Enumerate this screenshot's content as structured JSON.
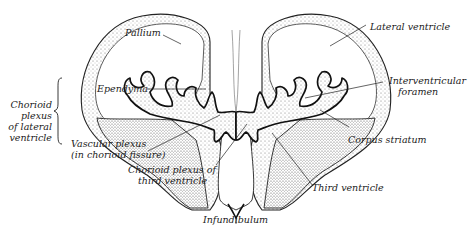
{
  "figure": {
    "labels": {
      "pallium": "Pallium",
      "lateral_ventricle": "Lateral ventricle",
      "ependyma": "Ependyma",
      "interventricular_foramen_1": "Interventricular",
      "interventricular_foramen_2": "foramen",
      "chorioid_plexus_lateral_1": "Chorioid",
      "chorioid_plexus_lateral_2": "plexus",
      "chorioid_plexus_lateral_3": "of lateral",
      "chorioid_plexus_lateral_4": "ventricle",
      "vascular_plexus_1": "Vascular plexus",
      "vascular_plexus_2": "(in chorioid fissure)",
      "corpus_striatum": "Corpus striatum",
      "chorioid_plexus_third_1": "Chorioid plexus of",
      "chorioid_plexus_third_2": "third ventricle",
      "third_ventricle": "Third ventricle",
      "infundibulum": "Infundibulum"
    },
    "colors": {
      "ink": "#1a1a1a",
      "stipple": "#9a9a9a",
      "background": "#ffffff"
    }
  }
}
